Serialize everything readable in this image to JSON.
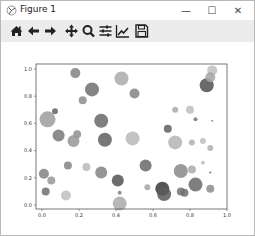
{
  "window": {
    "title": "Figure 1",
    "controls": {
      "minimize": "—",
      "maximize": "☐",
      "close": "✕"
    }
  },
  "toolbar": {
    "buttons": [
      {
        "name": "home",
        "icon": "home-icon"
      },
      {
        "name": "back",
        "icon": "arrow-left-icon"
      },
      {
        "name": "forward",
        "icon": "arrow-right-icon"
      },
      {
        "name": "pan",
        "icon": "move-icon"
      },
      {
        "name": "zoom",
        "icon": "magnifier-icon"
      },
      {
        "name": "subplots",
        "icon": "sliders-icon"
      },
      {
        "name": "customize",
        "icon": "line-chart-icon"
      },
      {
        "name": "save",
        "icon": "floppy-disk-icon"
      }
    ]
  },
  "chart_data": {
    "type": "scatter",
    "title": "",
    "xlabel": "",
    "ylabel": "",
    "xlim": [
      -0.03,
      1.0
    ],
    "ylim": [
      -0.03,
      1.04
    ],
    "grid": false,
    "x_ticks": [
      "0.0",
      "0.2",
      "0.4",
      "0.6",
      "0.8",
      "1.0"
    ],
    "y_ticks": [
      "0.0",
      "0.2",
      "0.4",
      "0.6",
      "0.8",
      "1.0"
    ],
    "marker_color": "gray (varying alpha)",
    "points": [
      {
        "x": 0.18,
        "y": 0.97,
        "size": 5,
        "shade": 0.55
      },
      {
        "x": 0.27,
        "y": 0.85,
        "size": 7,
        "shade": 0.45
      },
      {
        "x": 0.22,
        "y": 0.77,
        "size": 4,
        "shade": 0.6
      },
      {
        "x": 0.43,
        "y": 0.93,
        "size": 7,
        "shade": 0.75
      },
      {
        "x": 0.5,
        "y": 0.82,
        "size": 5,
        "shade": 0.55
      },
      {
        "x": 0.89,
        "y": 0.88,
        "size": 7,
        "shade": 0.3
      },
      {
        "x": 0.92,
        "y": 0.99,
        "size": 5,
        "shade": 0.85
      },
      {
        "x": 0.91,
        "y": 0.94,
        "size": 5,
        "shade": 0.72
      },
      {
        "x": 0.03,
        "y": 0.63,
        "size": 8,
        "shade": 0.68
      },
      {
        "x": 0.07,
        "y": 0.69,
        "size": 3,
        "shade": 0.4
      },
      {
        "x": 0.32,
        "y": 0.62,
        "size": 7,
        "shade": 0.42
      },
      {
        "x": 0.09,
        "y": 0.51,
        "size": 6,
        "shade": 0.5
      },
      {
        "x": 0.19,
        "y": 0.52,
        "size": 4,
        "shade": 0.62
      },
      {
        "x": 0.17,
        "y": 0.47,
        "size": 6,
        "shade": 0.65
      },
      {
        "x": 0.49,
        "y": 0.49,
        "size": 7,
        "shade": 0.82
      },
      {
        "x": 0.72,
        "y": 0.7,
        "size": 3,
        "shade": 0.75
      },
      {
        "x": 0.8,
        "y": 0.7,
        "size": 4,
        "shade": 0.85
      },
      {
        "x": 0.83,
        "y": 0.63,
        "size": 2,
        "shade": 0.5
      },
      {
        "x": 0.92,
        "y": 0.62,
        "size": 1,
        "shade": 0.55
      },
      {
        "x": 0.68,
        "y": 0.56,
        "size": 4,
        "shade": 0.38
      },
      {
        "x": 0.72,
        "y": 0.46,
        "size": 7,
        "shade": 0.8
      },
      {
        "x": 0.81,
        "y": 0.46,
        "size": 3,
        "shade": 0.78
      },
      {
        "x": 0.87,
        "y": 0.47,
        "size": 3,
        "shade": 0.85
      },
      {
        "x": 0.91,
        "y": 0.42,
        "size": 3,
        "shade": 0.78
      },
      {
        "x": 0.34,
        "y": 0.48,
        "size": 7,
        "shade": 0.38
      },
      {
        "x": 0.01,
        "y": 0.23,
        "size": 5,
        "shade": 0.55
      },
      {
        "x": 0.05,
        "y": 0.18,
        "size": 4,
        "shade": 0.65
      },
      {
        "x": 0.02,
        "y": 0.1,
        "size": 4,
        "shade": 0.45
      },
      {
        "x": 0.14,
        "y": 0.29,
        "size": 4,
        "shade": 0.55
      },
      {
        "x": 0.24,
        "y": 0.28,
        "size": 4,
        "shade": 0.82
      },
      {
        "x": 0.32,
        "y": 0.24,
        "size": 6,
        "shade": 0.55
      },
      {
        "x": 0.41,
        "y": 0.18,
        "size": 6,
        "shade": 0.32
      },
      {
        "x": 0.42,
        "y": 0.09,
        "size": 2,
        "shade": 0.55
      },
      {
        "x": 0.13,
        "y": 0.07,
        "size": 5,
        "shade": 0.85
      },
      {
        "x": 0.42,
        "y": 0.01,
        "size": 7,
        "shade": 0.75
      },
      {
        "x": 0.56,
        "y": 0.29,
        "size": 6,
        "shade": 0.42
      },
      {
        "x": 0.57,
        "y": 0.13,
        "size": 3,
        "shade": 0.72
      },
      {
        "x": 0.65,
        "y": 0.12,
        "size": 7,
        "shade": 0.18
      },
      {
        "x": 0.66,
        "y": 0.08,
        "size": 7,
        "shade": 0.35
      },
      {
        "x": 0.75,
        "y": 0.25,
        "size": 7,
        "shade": 0.58
      },
      {
        "x": 0.81,
        "y": 0.26,
        "size": 4,
        "shade": 0.75
      },
      {
        "x": 0.75,
        "y": 0.1,
        "size": 4,
        "shade": 0.48
      },
      {
        "x": 0.77,
        "y": 0.09,
        "size": 4,
        "shade": 0.45
      },
      {
        "x": 0.83,
        "y": 0.15,
        "size": 7,
        "shade": 0.42
      },
      {
        "x": 0.87,
        "y": 0.31,
        "size": 2,
        "shade": 0.85
      },
      {
        "x": 0.91,
        "y": 0.24,
        "size": 1,
        "shade": 0.35
      },
      {
        "x": 0.91,
        "y": 0.12,
        "size": 4,
        "shade": 0.6
      }
    ]
  }
}
